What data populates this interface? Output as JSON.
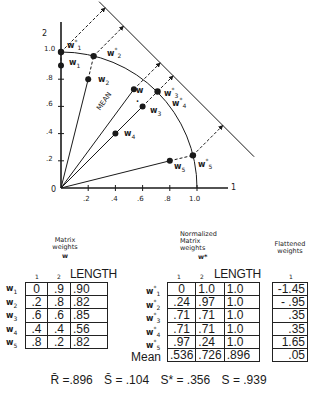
{
  "chart_data": {
    "type": "scatter",
    "title": "",
    "xlabel": "1",
    "ylabel": "2",
    "origin_label": "0",
    "x_ticks": [
      ".2",
      ".4",
      ".6",
      ".8",
      "1.0"
    ],
    "y_ticks": [
      ".2",
      ".4",
      ".6",
      ".8",
      "1.0"
    ],
    "xlim": [
      0,
      1.4
    ],
    "ylim": [
      0,
      1.4
    ],
    "unit_circle_arc": true,
    "projection_line": "x + y = 1.65",
    "mean_label": "MEAN",
    "series": [
      {
        "name": "w (matrix weights)",
        "points": [
          {
            "label": "w1",
            "x": 0,
            "y": 0.9
          },
          {
            "label": "w2",
            "x": 0.2,
            "y": 0.8
          },
          {
            "label": "w3",
            "x": 0.6,
            "y": 0.6
          },
          {
            "label": "w4",
            "x": 0.4,
            "y": 0.4
          },
          {
            "label": "w5",
            "x": 0.8,
            "y": 0.2
          },
          {
            "label": "w",
            "x": 0.536,
            "y": 0.726
          }
        ]
      },
      {
        "name": "w* (normalized)",
        "points": [
          {
            "label": "w1*",
            "x": 0,
            "y": 1.0
          },
          {
            "label": "w2*",
            "x": 0.24,
            "y": 0.97
          },
          {
            "label": "w3* w4*",
            "x": 0.71,
            "y": 0.71
          },
          {
            "label": "w5*",
            "x": 0.97,
            "y": 0.24
          }
        ]
      }
    ]
  },
  "captions": {
    "matrix": {
      "line1": "Matrix",
      "line2": "weights",
      "symbol": "w"
    },
    "normalized": {
      "line1": "Normalized",
      "line2": "Matrix",
      "line3": "weights",
      "symbol": "w*"
    },
    "flattened": {
      "line1": "Flattened",
      "line2": "weights"
    }
  },
  "matrix_table": {
    "col_headers": [
      "1",
      "2",
      "LENGTH"
    ],
    "row_labels": [
      "w",
      "w",
      "w",
      "w",
      "w"
    ],
    "row_subs": [
      "1",
      "2",
      "3",
      "4",
      "5"
    ],
    "rows": [
      [
        "0",
        ".9",
        ".90"
      ],
      [
        ".2",
        ".8",
        ".82"
      ],
      [
        ".6",
        ".6",
        ".85"
      ],
      [
        ".4",
        ".4",
        ".56"
      ],
      [
        ".8",
        ".2",
        ".82"
      ]
    ]
  },
  "normalized_table": {
    "col_headers": [
      "1",
      "2",
      "LENGTH"
    ],
    "row_labels": [
      "w",
      "w",
      "w",
      "w",
      "w"
    ],
    "row_subs": [
      "1",
      "2",
      "3",
      "4",
      "5"
    ],
    "rows": [
      [
        "0",
        "1.0",
        "1.0"
      ],
      [
        ".24",
        ".97",
        "1.0"
      ],
      [
        ".71",
        ".71",
        "1.0"
      ],
      [
        ".71",
        ".71",
        "1.0"
      ],
      [
        ".97",
        ".24",
        "1.0"
      ]
    ],
    "mean_label": "Mean",
    "mean_row": [
      ".536",
      ".726",
      ".896"
    ]
  },
  "flattened_table": {
    "col_header": "1",
    "values": [
      "-1.45",
      "- .95",
      ".35",
      ".35",
      "1.65",
      ".05"
    ]
  },
  "stats": {
    "r_bar": "R̄ =.896",
    "s_bar": "S̄ = .104",
    "s_star": "S* = .356",
    "s": "S = .939"
  }
}
